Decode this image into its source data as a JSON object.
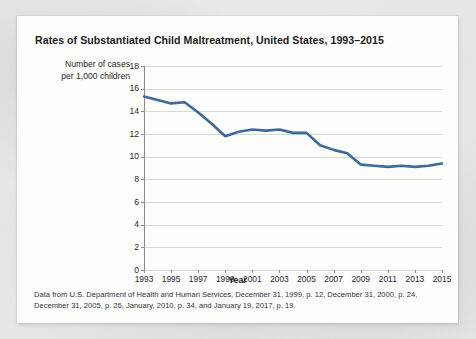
{
  "card": {
    "title": "Rates of Substantiated Child Maltreatment, United States, 1993–2015",
    "source_note": "Data from U.S. Department of Health and Human Services, December 31, 1999, p. 12, December 31, 2000, p. 24, December 31, 2005, p. 26, January, 2010, p. 34, and January 19, 2017, p. 19."
  },
  "chart_data": {
    "type": "line",
    "title": "Rates of Substantiated Child Maltreatment, United States, 1993–2015",
    "xlabel": "Year",
    "ylabel": "Number of cases per 1,000 children",
    "ylabel_line1": "Number of cases",
    "ylabel_line2": "per 1,000 children",
    "ylim": [
      0,
      18
    ],
    "yticks": [
      18,
      16,
      14,
      12,
      10,
      8,
      6,
      4,
      2,
      0
    ],
    "xlim": [
      1993,
      2015
    ],
    "xticks": [
      1993,
      1995,
      1997,
      1999,
      2001,
      2003,
      2005,
      2007,
      2009,
      2011,
      2013,
      2015
    ],
    "grid": true,
    "legend": "none",
    "line_color": "#3d6a9c",
    "line_width": 2.6,
    "x": [
      1993,
      1994,
      1995,
      1996,
      1997,
      1998,
      1999,
      2000,
      2001,
      2002,
      2003,
      2004,
      2005,
      2006,
      2007,
      2008,
      2009,
      2010,
      2011,
      2012,
      2013,
      2014,
      2015
    ],
    "values": [
      15.3,
      15.0,
      14.7,
      14.8,
      13.9,
      12.9,
      11.8,
      12.2,
      12.4,
      12.3,
      12.4,
      12.1,
      12.1,
      11.0,
      10.6,
      10.3,
      9.3,
      9.2,
      9.1,
      9.2,
      9.1,
      9.2,
      9.4
    ],
    "series": [
      {
        "name": "Substantiated child maltreatment rate",
        "values": [
          15.3,
          15.0,
          14.7,
          14.8,
          13.9,
          12.9,
          11.8,
          12.2,
          12.4,
          12.3,
          12.4,
          12.1,
          12.1,
          11.0,
          10.6,
          10.3,
          9.3,
          9.2,
          9.1,
          9.2,
          9.1,
          9.2,
          9.4
        ]
      }
    ]
  }
}
